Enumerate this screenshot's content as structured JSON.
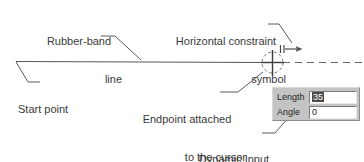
{
  "figure": {
    "line_color": "#4d4d4d",
    "text_color": "#3a3a3a",
    "panel_bg_color": "#c4c4c4",
    "field_bg_color": "#ffffff",
    "selection_color": "#4a4a4a"
  },
  "annotations": [
    {
      "id": "rubber-band",
      "line1": "Rubber-band",
      "line2": "line"
    },
    {
      "id": "horizontal-constraint",
      "line1": "Horizontal constraint",
      "line2": "symbol"
    },
    {
      "id": "start-point",
      "line1": "Start point",
      "line2": ""
    },
    {
      "id": "endpoint",
      "line1": "Endpoint attached",
      "line2": "to the cursor"
    },
    {
      "id": "dynamic-input",
      "line1": "Dynamic Input",
      "line2": "Boxes"
    }
  ],
  "dynamic_input": {
    "rows": [
      {
        "label": "Length",
        "value": "35",
        "selected": true
      },
      {
        "label": "Angle",
        "value": "0",
        "selected": false
      }
    ]
  },
  "drawing": {
    "start_point_label": "start-point-vertex",
    "endpoint_label": "endpoint-cursor",
    "constraint_symbol": "horizontal-constraint-arrow",
    "cursor_glyph": "crosshair-cursor",
    "tracking_line": "dashed-horizontal-tracking-line"
  }
}
